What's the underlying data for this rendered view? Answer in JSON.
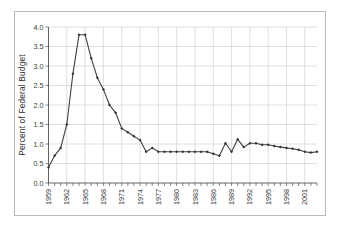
{
  "figure": {
    "background_color": "#ffffff",
    "frame_color": "#b9b9b9"
  },
  "chart_data": {
    "type": "line",
    "title": "",
    "subtitle": "",
    "xlabel": "",
    "ylabel": "Percent of Federal Budget",
    "xlim": [
      1959,
      2003
    ],
    "ylim": [
      0.0,
      4.0
    ],
    "grid": true,
    "legend": false,
    "legend_position": "none",
    "line_color": "#404040",
    "marker_color": "#333333",
    "marker": "diamond",
    "y_ticks": [
      "0.0",
      "0.5",
      "1.0",
      "1.5",
      "2.0",
      "2.5",
      "3.0",
      "3.5",
      "4.0"
    ],
    "y_tick_values": [
      0.0,
      0.5,
      1.0,
      1.5,
      2.0,
      2.5,
      3.0,
      3.5,
      4.0
    ],
    "x_tick_labels": [
      "1959",
      "1962",
      "1965",
      "1968",
      "1971",
      "1974",
      "1977",
      "1980",
      "1983",
      "1986",
      "1989",
      "1992",
      "1995",
      "1998",
      "2001"
    ],
    "x_tick_values": [
      1959,
      1962,
      1965,
      1968,
      1971,
      1974,
      1977,
      1980,
      1983,
      1986,
      1989,
      1992,
      1995,
      1998,
      2001
    ],
    "x": [
      1959,
      1960,
      1961,
      1962,
      1963,
      1964,
      1965,
      1966,
      1967,
      1968,
      1969,
      1970,
      1971,
      1972,
      1973,
      1974,
      1975,
      1976,
      1977,
      1978,
      1979,
      1980,
      1981,
      1982,
      1983,
      1984,
      1985,
      1986,
      1987,
      1988,
      1989,
      1990,
      1991,
      1992,
      1993,
      1994,
      1995,
      1996,
      1997,
      1998,
      1999,
      2000,
      2001,
      2002,
      2003
    ],
    "values": [
      0.4,
      0.7,
      0.9,
      1.5,
      2.8,
      3.8,
      3.8,
      3.2,
      2.7,
      2.4,
      2.0,
      1.8,
      1.4,
      1.3,
      1.2,
      1.1,
      0.8,
      0.9,
      0.8,
      0.8,
      0.8,
      0.8,
      0.8,
      0.8,
      0.8,
      0.8,
      0.8,
      0.75,
      0.7,
      1.02,
      0.8,
      1.12,
      0.92,
      1.02,
      1.02,
      0.98,
      0.98,
      0.95,
      0.92,
      0.9,
      0.88,
      0.85,
      0.8,
      0.78,
      0.8
    ]
  }
}
